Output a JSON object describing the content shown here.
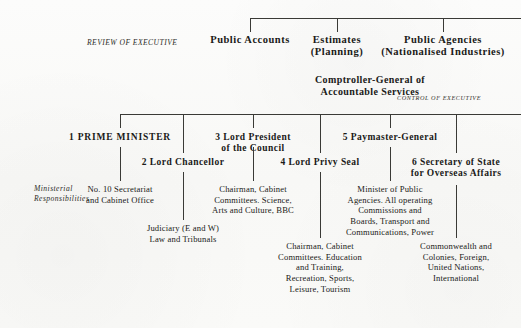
{
  "diagram": {
    "background_color": "#fbfbfa",
    "line_color": "#3a3a36",
    "text_color": "#1a1a18"
  },
  "side_labels": {
    "review_of_executive": "REVIEW OF EXECUTIVE",
    "control_of_executive": "CONTROL OF EXECUTIVE",
    "ministerial_responsibilities_line1": "Ministerial",
    "ministerial_responsibilities_line2": "Responsibilities"
  },
  "committees": [
    {
      "id": "public-accounts",
      "line1": "Public Accounts",
      "line2": ""
    },
    {
      "id": "estimates",
      "line1": "Estimates",
      "line2": "(Planning)"
    },
    {
      "id": "public-agencies",
      "line1": "Public Agencies",
      "line2": "(Nationalised Industries)"
    }
  ],
  "comptroller": {
    "line1": "Comptroller-General of",
    "line2": "Accountable Services"
  },
  "offices": [
    {
      "id": "prime-minister",
      "number": "1",
      "title": "PRIME MINISTER",
      "title_line2": "",
      "responsibilities": [
        "No. 10 Secretariat",
        "and Cabinet Office"
      ]
    },
    {
      "id": "lord-chancellor",
      "number": "2",
      "title": "Lord Chancellor",
      "title_line2": "",
      "responsibilities": [
        "Judiciary (E and W)",
        "Law and Tribunals"
      ]
    },
    {
      "id": "lord-president-of-the-council",
      "number": "3",
      "title": "Lord President",
      "title_line2": "of the Council",
      "responsibilities": [
        "Chairman, Cabinet",
        "Committees. Science,",
        "Arts and Culture, BBC"
      ]
    },
    {
      "id": "lord-privy-seal",
      "number": "4",
      "title": "Lord Privy Seal",
      "title_line2": "",
      "responsibilities": [
        "Chairman, Cabinet",
        "Committees. Education",
        "and Training,",
        "Recreation, Sports,",
        "Leisure, Tourism"
      ]
    },
    {
      "id": "paymaster-general",
      "number": "5",
      "title": "Paymaster-General",
      "title_line2": "",
      "responsibilities": [
        "Minister of Public",
        "Agencies. All operating",
        "Commissions and",
        "Boards, Transport and",
        "Communications, Power"
      ]
    },
    {
      "id": "secretary-of-state-for-overseas-affairs",
      "number": "6",
      "title": "Secretary of State",
      "title_line2": "for Overseas Affairs",
      "responsibilities": [
        "Commonwealth and",
        "Colonies, Foreign,",
        "United Nations,",
        "International"
      ]
    }
  ]
}
